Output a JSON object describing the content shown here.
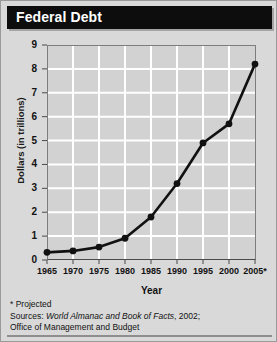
{
  "title": "Federal Debt",
  "footnotes": {
    "projected_note": "* Projected",
    "sources_prefix": "Sources: ",
    "sources_italic": "World Almanac and Book of Facts",
    "sources_suffix": ", 2002;",
    "sources_line2": "Office of Management and Budget"
  },
  "colors": {
    "title_bar": "#0d0d0d",
    "title_text": "#ffffff",
    "card_background": "#d9d9d9",
    "plot_background": "#d2d2d2",
    "gridline": "#ffffff",
    "series_line": "#111111",
    "axis": "#4a4a4a"
  },
  "chart_data": {
    "type": "line",
    "title": "Federal Debt",
    "xlabel": "Year",
    "ylabel": "Dollars (in trillions)",
    "categories": [
      "1965",
      "1970",
      "1975",
      "1980",
      "1985",
      "1990",
      "1995",
      "2000",
      "2005*"
    ],
    "x": [
      1965,
      1970,
      1975,
      1980,
      1985,
      1990,
      1995,
      2000,
      2005
    ],
    "values": [
      0.32,
      0.38,
      0.54,
      0.91,
      1.8,
      3.2,
      4.9,
      5.7,
      8.2
    ],
    "ylim": [
      0,
      9
    ],
    "yticks": [
      0,
      1,
      2,
      3,
      4,
      5,
      6,
      7,
      8,
      9
    ],
    "xlim": [
      1965,
      2005
    ],
    "grid": true,
    "legend": false,
    "marker": "circle",
    "annotations": [
      "* Projected"
    ]
  }
}
